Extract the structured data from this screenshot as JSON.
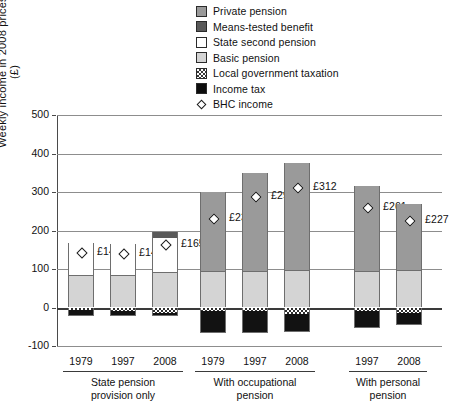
{
  "chart_data": {
    "type": "bar",
    "title": "",
    "xlabel": "",
    "ylabel": "Weekly income in 2008 prices (£)",
    "ylim": [
      -100,
      500
    ],
    "yticks": [
      500,
      400,
      300,
      200,
      100,
      0,
      -100
    ],
    "ytick_labels": [
      "500",
      "400",
      "300",
      "200",
      "100",
      "0",
      "-100"
    ],
    "grid": true,
    "legend_position": "top",
    "stacked": true,
    "legend": [
      {
        "label": "Private pension",
        "swatch": "private-pension-swatch",
        "color": "#9a9a9a"
      },
      {
        "label": "Means-tested benefit",
        "swatch": "means-tested-benefit-swatch",
        "color": "#595959"
      },
      {
        "label": "State second pension",
        "swatch": "state-second-pension-swatch",
        "color": "#ffffff"
      },
      {
        "label": "Basic pension",
        "swatch": "basic-pension-swatch",
        "color": "#d4d4d4"
      },
      {
        "label": "Local government taxation",
        "swatch": "local-government-taxation-swatch",
        "color": "checkered"
      },
      {
        "label": "Income tax",
        "swatch": "income-tax-swatch",
        "color": "#0d0d0d"
      },
      {
        "label": "BHC income",
        "swatch": "bhc-income-marker",
        "color": "#ffffff"
      }
    ],
    "groups": [
      {
        "name": "State pension provision only",
        "title_lines": [
          "State pension",
          "provision only"
        ],
        "bars": [
          {
            "category": "1979",
            "bhc_income": 143,
            "bhc_label": "£143",
            "segments": [
              {
                "series": "Basic pension",
                "value": 85
              },
              {
                "series": "State second pension",
                "value": 83
              },
              {
                "series": "Means-tested benefit",
                "value": 0
              },
              {
                "series": "Private pension",
                "value": 0
              },
              {
                "series": "Local government taxation",
                "value": -7
              },
              {
                "series": "Income tax",
                "value": -16
              }
            ]
          },
          {
            "category": "1997",
            "bhc_income": 141,
            "bhc_label": "£141",
            "segments": [
              {
                "series": "Basic pension",
                "value": 85
              },
              {
                "series": "State second pension",
                "value": 80
              },
              {
                "series": "Means-tested benefit",
                "value": 0
              },
              {
                "series": "Private pension",
                "value": 0
              },
              {
                "series": "Local government taxation",
                "value": -9
              },
              {
                "series": "Income tax",
                "value": -14
              }
            ]
          },
          {
            "category": "2008",
            "bhc_income": 165,
            "bhc_label": "£165",
            "segments": [
              {
                "series": "Basic pension",
                "value": 92
              },
              {
                "series": "State second pension",
                "value": 88
              },
              {
                "series": "Means-tested benefit",
                "value": 15
              },
              {
                "series": "Private pension",
                "value": 0
              },
              {
                "series": "Local government taxation",
                "value": -15
              },
              {
                "series": "Income tax",
                "value": -8
              }
            ]
          }
        ]
      },
      {
        "name": "With occupational pension",
        "title_lines": [
          "With occupational",
          "pension"
        ],
        "bars": [
          {
            "category": "1979",
            "bhc_income": 232,
            "bhc_label": "£232",
            "segments": [
              {
                "series": "Basic pension",
                "value": 95
              },
              {
                "series": "State second pension",
                "value": 0
              },
              {
                "series": "Means-tested benefit",
                "value": 0
              },
              {
                "series": "Private pension",
                "value": 205
              },
              {
                "series": "Local government taxation",
                "value": -8
              },
              {
                "series": "Income tax",
                "value": -58
              }
            ]
          },
          {
            "category": "1997",
            "bhc_income": 290,
            "bhc_label": "£290",
            "segments": [
              {
                "series": "Basic pension",
                "value": 95
              },
              {
                "series": "State second pension",
                "value": 0
              },
              {
                "series": "Means-tested benefit",
                "value": 0
              },
              {
                "series": "Private pension",
                "value": 255
              },
              {
                "series": "Local government taxation",
                "value": -8
              },
              {
                "series": "Income tax",
                "value": -57
              }
            ]
          },
          {
            "category": "2008",
            "bhc_income": 312,
            "bhc_label": "£312",
            "segments": [
              {
                "series": "Basic pension",
                "value": 98
              },
              {
                "series": "State second pension",
                "value": 0
              },
              {
                "series": "Means-tested benefit",
                "value": 0
              },
              {
                "series": "Private pension",
                "value": 277
              },
              {
                "series": "Local government taxation",
                "value": -17
              },
              {
                "series": "Income tax",
                "value": -47
              }
            ]
          }
        ]
      },
      {
        "name": "With personal pension",
        "title_lines": [
          "With personal",
          "pension"
        ],
        "bars": [
          {
            "category": "1997",
            "bhc_income": 261,
            "bhc_label": "£261",
            "segments": [
              {
                "series": "Basic pension",
                "value": 95
              },
              {
                "series": "State second pension",
                "value": 0
              },
              {
                "series": "Means-tested benefit",
                "value": 0
              },
              {
                "series": "Private pension",
                "value": 220
              },
              {
                "series": "Local government taxation",
                "value": -10
              },
              {
                "series": "Income tax",
                "value": -44
              }
            ]
          },
          {
            "category": "2008",
            "bhc_income": 227,
            "bhc_label": "£227",
            "segments": [
              {
                "series": "Basic pension",
                "value": 97
              },
              {
                "series": "State second pension",
                "value": 0
              },
              {
                "series": "Means-tested benefit",
                "value": 0
              },
              {
                "series": "Private pension",
                "value": 173
              },
              {
                "series": "Local government taxation",
                "value": -14
              },
              {
                "series": "Income tax",
                "value": -31
              }
            ]
          }
        ]
      }
    ]
  }
}
